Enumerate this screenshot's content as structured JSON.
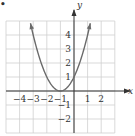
{
  "chart_data": {
    "type": "line",
    "title": "",
    "function": "y = (x + 1)^2",
    "xlabel": "x",
    "ylabel": "y",
    "xlim": [
      -5,
      3
    ],
    "ylim": [
      -3,
      5
    ],
    "grid": true,
    "x_ticks": [
      -4,
      -3,
      -2,
      -1,
      1,
      2
    ],
    "y_ticks": [
      4,
      3,
      2,
      1,
      -1,
      -2
    ],
    "x_tick_labels": [
      "−4",
      "−3",
      "−2",
      "−1",
      "1",
      "2"
    ],
    "y_tick_labels": [
      "4",
      "3",
      "2",
      "1",
      "−1",
      "−2"
    ],
    "series": [
      {
        "name": "parabola",
        "x": [
          -3.2,
          -3,
          -2.5,
          -2,
          -1.5,
          -1,
          -0.5,
          0,
          0.5,
          1,
          1.2
        ],
        "y": [
          4.84,
          4,
          2.25,
          1,
          0.25,
          0,
          0.25,
          1,
          2.25,
          4,
          4.84
        ],
        "arrows_at_ends": true
      }
    ],
    "vertex": [
      -1,
      0
    ],
    "legend": null
  },
  "marker_text": "•",
  "colors": {
    "grid": "#cfcfcf",
    "axis": "#333333",
    "curve": "#6a6a6a",
    "background": "#ffffff"
  }
}
